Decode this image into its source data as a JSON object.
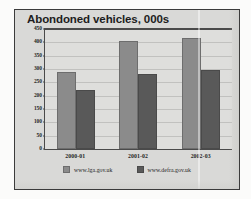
{
  "chart_data": {
    "type": "bar",
    "title": "Abondoned vehicles, 000s",
    "subtitle": "",
    "xlabel": "",
    "ylabel": "",
    "categories": [
      "2000-01",
      "2001-02",
      "2002-03"
    ],
    "series": [
      {
        "name": "www.lga.gov.uk",
        "color": "#8b8b8b",
        "values": [
          287,
          405,
          415
        ]
      },
      {
        "name": "www.defra.gov.uk",
        "color": "#595959",
        "values": [
          221,
          283,
          295
        ]
      }
    ],
    "ylim": [
      0,
      450
    ],
    "ytick_step": 50,
    "ytick_labels": [
      "450",
      "400",
      "350",
      "300",
      "250",
      "200",
      "150",
      "100",
      "50",
      "0"
    ],
    "grid": true,
    "legend_position": "bottom",
    "annotations": []
  },
  "chart": {
    "title": "Abondoned vehicles, 000s",
    "plot_background": "#dededc",
    "card_background": "#d9d9d7",
    "axis_color": "#4a4a4a"
  },
  "legend": {
    "entries": [
      {
        "label": "www.lga.gov.uk",
        "swatch": "series-0-swatch"
      },
      {
        "label": "www.defra.gov.uk",
        "swatch": "series-1-swatch"
      }
    ]
  }
}
